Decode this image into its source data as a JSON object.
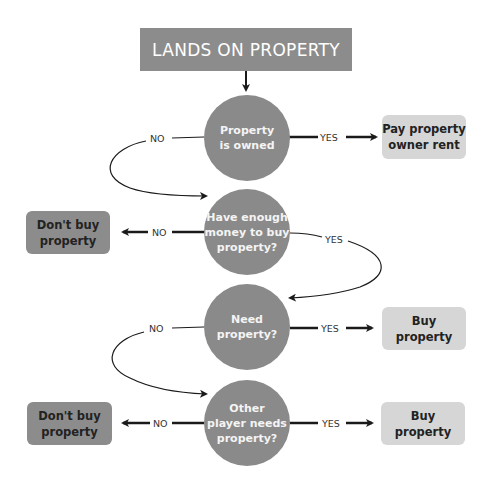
{
  "header": {
    "title": "LANDS ON PROPERTY"
  },
  "decisions": [
    {
      "lines": [
        "Property",
        "is owned"
      ]
    },
    {
      "lines": [
        "Have enough",
        "money to buy",
        "property?"
      ]
    },
    {
      "lines": [
        "Need",
        "property?"
      ]
    },
    {
      "lines": [
        "Other",
        "player needs",
        "property?"
      ]
    }
  ],
  "outcomes": {
    "pay_rent": {
      "lines": [
        "Pay property",
        "owner rent"
      ]
    },
    "dont_buy_1": {
      "lines": [
        "Don't buy",
        "property"
      ]
    },
    "buy_1": {
      "lines": [
        "Buy",
        "property"
      ]
    },
    "dont_buy_2": {
      "lines": [
        "Don't buy",
        "property"
      ]
    },
    "buy_2": {
      "lines": [
        "Buy",
        "property"
      ]
    }
  },
  "labels": {
    "yes": "YES",
    "no": "NO"
  },
  "colors": {
    "header_bg": "#8c8c8c",
    "decision_bg": "#8a8a8a",
    "negative_box_bg": "#8c8c8c",
    "positive_box_bg": "#d6d6d6",
    "line": "#1a1a1a"
  }
}
